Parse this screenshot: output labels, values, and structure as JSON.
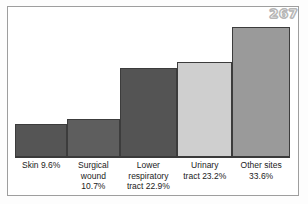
{
  "figure": {
    "page_number": "267",
    "background_color": "#ffffff",
    "frame_color": "#9e9e9e",
    "baseline_color": "#3a3a3a"
  },
  "chart_data": {
    "type": "bar",
    "title": "",
    "subtitle": "",
    "xlabel": "",
    "ylabel": "",
    "grid": false,
    "legend": false,
    "ylim": [
      0,
      36
    ],
    "categories": [
      "Skin",
      "Surgical wound",
      "Lower respiratory tract",
      "Urinary tract",
      "Other sites"
    ],
    "values": [
      9.6,
      10.7,
      22.9,
      23.2,
      33.6
    ],
    "value_labels": [
      "9.6%",
      "10.7%",
      "22.9%",
      "23.2%",
      "33.6%"
    ],
    "tick_labels": [
      "Skin 9.6%",
      "Surgical wound 10.7%",
      "Lower respiratory tract 22.9%",
      "Urinary tract 23.2%",
      "Other sites 33.6%"
    ],
    "bar_colors": [
      "#555555",
      "#5e5e5e",
      "#545454",
      "#cfcfcf",
      "#9a9a9a"
    ],
    "bar_edge_color": "#3c3c3c",
    "bars": [
      {
        "category": "Skin",
        "value": 9.6,
        "value_label": "9.6%",
        "label_lines": [
          "Skin 9.6%"
        ],
        "color": "#555555",
        "height_pct": 22.5,
        "width_pct": 19.0
      },
      {
        "category": "Surgical wound",
        "value": 10.7,
        "value_label": "10.7%",
        "label_lines": [
          "Surgical",
          "wound",
          "10.7%"
        ],
        "color": "#5e5e5e",
        "height_pct": 26.0,
        "width_pct": 19.0
      },
      {
        "category": "Lower respiratory tract",
        "value": 22.9,
        "value_label": "22.9%",
        "label_lines": [
          "Lower",
          "respiratory",
          "tract 22.9%"
        ],
        "color": "#545454",
        "height_pct": 62.0,
        "width_pct": 21.0
      },
      {
        "category": "Urinary tract",
        "value": 23.2,
        "value_label": "23.2%",
        "label_lines": [
          "Urinary",
          "tract 23.2%"
        ],
        "color": "#cfcfcf",
        "height_pct": 66.5,
        "width_pct": 20.0
      },
      {
        "category": "Other sites",
        "value": 33.6,
        "value_label": "33.6%",
        "label_lines": [
          "Other sites",
          "33.6%"
        ],
        "color": "#9a9a9a",
        "height_pct": 91.0,
        "width_pct": 21.0
      }
    ]
  }
}
